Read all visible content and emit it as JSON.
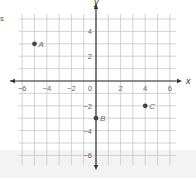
{
  "page": {
    "left_fragment_text": "s"
  },
  "chart_data": {
    "type": "scatter",
    "title": "",
    "xlabel": "x",
    "ylabel": "y",
    "xlim": [
      -6.5,
      6.5
    ],
    "ylim": [
      -7,
      6
    ],
    "grid": true,
    "x_ticks": [
      -6,
      -4,
      -2,
      0,
      2,
      4,
      6
    ],
    "y_ticks": [
      -6,
      -4,
      -2,
      2,
      4
    ],
    "x_tick_labels": [
      "−6",
      "−4",
      "−2",
      "0",
      "2",
      "4",
      "6"
    ],
    "y_tick_labels": [
      "−6",
      "−4",
      "−2",
      "2",
      "4"
    ],
    "points": [
      {
        "label": "A",
        "x": -5,
        "y": 3
      },
      {
        "label": "B",
        "x": 0,
        "y": -3
      },
      {
        "label": "C",
        "x": 4,
        "y": -2
      }
    ],
    "legend": null,
    "colors": {
      "axis": "#333333",
      "grid": "#c8c8c8",
      "point": "#444444",
      "text": "#666666"
    }
  }
}
